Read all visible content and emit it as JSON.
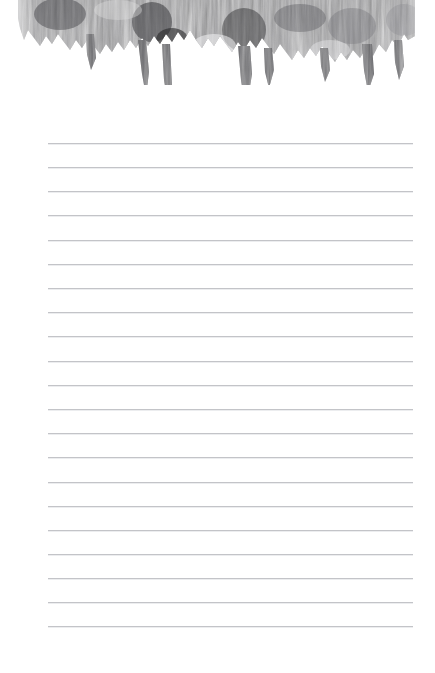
{
  "page": {
    "name": "lined-note-page",
    "width": 435,
    "height": 673,
    "background_color": "#ffffff",
    "content_text": ""
  },
  "banner": {
    "name": "textured-header-image",
    "description": "grayscale ragged vertical-streak texture strip along the top edge",
    "left": 18,
    "top": 0,
    "width": 397,
    "height": 85,
    "palette": {
      "darkest": "#1d1d1f",
      "dark": "#4a4a4d",
      "mid": "#8b8b8e",
      "light": "#bdbdc0",
      "lightest": "#e8e8ea",
      "paper": "#ffffff"
    },
    "ragged_bottom": true
  },
  "ruled_lines": {
    "name": "ruled-lines-group",
    "count": 21,
    "first_y": 143,
    "spacing": 24.1,
    "left_x": 48,
    "right_x": 413,
    "color": "#c3c4c8",
    "thickness": 1,
    "y_positions": [
      143,
      167,
      191,
      215,
      240,
      264,
      288,
      312,
      336,
      361,
      385,
      409,
      433,
      457,
      482,
      506,
      530,
      554,
      578,
      602,
      626
    ]
  },
  "margins": {
    "name": "page-margins",
    "left": 48,
    "right": 22,
    "top_to_first_line": 143,
    "bottom_after_last_line": 47
  }
}
